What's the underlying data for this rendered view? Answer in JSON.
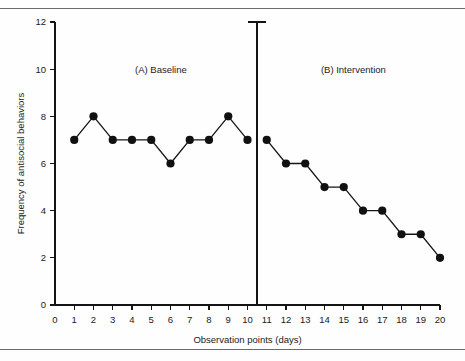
{
  "figure": {
    "top_rule": "horizontal-rule",
    "bottom_rule": "horizontal-rule"
  },
  "chart_data": {
    "type": "line",
    "title": "",
    "subtitle": "",
    "xlabel": "Observation points (days)",
    "ylabel": "Frequency of antisocial behaviors",
    "xlim": [
      0,
      20
    ],
    "ylim": [
      0,
      12
    ],
    "x_ticks": [
      0,
      1,
      2,
      3,
      4,
      5,
      6,
      7,
      8,
      9,
      10,
      11,
      12,
      13,
      14,
      15,
      16,
      17,
      18,
      19,
      20
    ],
    "y_ticks": [
      0,
      2,
      4,
      6,
      8,
      10,
      12
    ],
    "grid": false,
    "legend_position": "none",
    "marker": "filled-circle",
    "line_color": "#141414",
    "marker_color": "#111111",
    "background_color": "#fefefe",
    "annotations": [
      {
        "text": "(A) Baseline",
        "x": 5.5,
        "y": 10
      },
      {
        "text": "(B) Intervention",
        "x": 15.5,
        "y": 10
      }
    ],
    "phase_divider": {
      "x": 10.5,
      "label": "phase-change-line",
      "cap": true
    },
    "series": [
      {
        "name": "Baseline",
        "x": [
          1,
          2,
          3,
          4,
          5,
          6,
          7,
          8,
          9,
          10
        ],
        "values": [
          7,
          8,
          7,
          7,
          7,
          6,
          7,
          7,
          8,
          7
        ]
      },
      {
        "name": "Intervention",
        "x": [
          11,
          12,
          13,
          14,
          15,
          16,
          17,
          18,
          19,
          20
        ],
        "values": [
          7,
          6,
          6,
          5,
          5,
          4,
          4,
          3,
          3,
          2
        ]
      }
    ]
  }
}
